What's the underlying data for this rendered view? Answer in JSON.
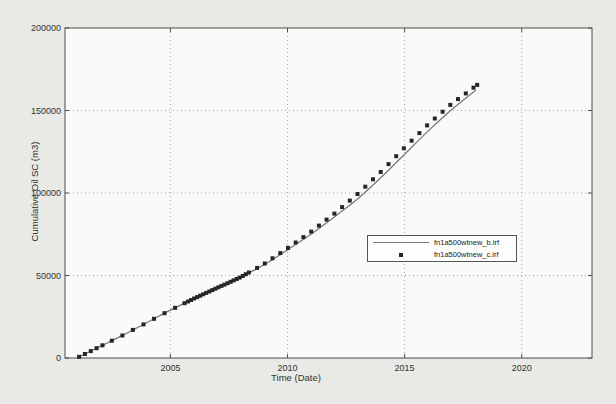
{
  "figure": {
    "bg_color": "#e9eae5",
    "plot_bg_color": "#fafaf8",
    "axis_color": "#4f4f4f",
    "grid_color": "#a8a8a4",
    "tick_text_color": "#333333"
  },
  "chart_data": {
    "type": "line",
    "title": "",
    "xlabel": "Time (Date)",
    "ylabel": "Cumulative Oil SC (m3)",
    "xlim": [
      2000.5,
      2023
    ],
    "ylim": [
      0,
      200000
    ],
    "x_ticks": [
      2005,
      2010,
      2015,
      2020
    ],
    "x_tick_labels": [
      "2005",
      "2010",
      "2015",
      "2020"
    ],
    "y_ticks": [
      0,
      50000,
      100000,
      150000,
      200000
    ],
    "y_tick_labels": [
      "0",
      "50000",
      "100000",
      "150000",
      "200000"
    ],
    "grid": "dotted",
    "legend_position": "right-center",
    "series": [
      {
        "name": "fn1a500wtnew_b.irf",
        "type": "line",
        "color": "#767676",
        "points": [
          [
            2001.0,
            0
          ],
          [
            2002,
            7000
          ],
          [
            2003,
            14000
          ],
          [
            2004,
            21500
          ],
          [
            2005,
            29000
          ],
          [
            2006,
            36000
          ],
          [
            2007,
            42500
          ],
          [
            2008,
            49000
          ],
          [
            2009,
            56500
          ],
          [
            2010,
            65500
          ],
          [
            2011,
            75000
          ],
          [
            2012,
            85500
          ],
          [
            2013,
            96500
          ],
          [
            2014,
            109500
          ],
          [
            2015,
            123500
          ],
          [
            2016,
            137500
          ],
          [
            2017,
            150500
          ],
          [
            2018.05,
            162500
          ]
        ]
      },
      {
        "name": "fn1a500wtnew_c.irf",
        "type": "scatter",
        "marker": "square",
        "color": "#262626",
        "points": [
          [
            2001.1,
            700
          ],
          [
            2001.35,
            2450
          ],
          [
            2001.6,
            4200
          ],
          [
            2001.85,
            5950
          ],
          [
            2002.1,
            7700
          ],
          [
            2002.5,
            10500
          ],
          [
            2002.95,
            13650
          ],
          [
            2003.4,
            17000
          ],
          [
            2003.85,
            20375
          ],
          [
            2004.3,
            23750
          ],
          [
            2004.75,
            27125
          ],
          [
            2005.2,
            30400
          ],
          [
            2005.6,
            33200
          ],
          [
            2005.75,
            34250
          ],
          [
            2005.88,
            35160
          ],
          [
            2006.01,
            36065
          ],
          [
            2006.14,
            36910
          ],
          [
            2006.27,
            37755
          ],
          [
            2006.4,
            38600
          ],
          [
            2006.53,
            39445
          ],
          [
            2006.66,
            40290
          ],
          [
            2006.79,
            41135
          ],
          [
            2006.92,
            41980
          ],
          [
            2007.05,
            42825
          ],
          [
            2007.18,
            43670
          ],
          [
            2007.31,
            44515
          ],
          [
            2007.44,
            45360
          ],
          [
            2007.57,
            46205
          ],
          [
            2007.7,
            47050
          ],
          [
            2007.83,
            47895
          ],
          [
            2007.96,
            48740
          ],
          [
            2008.09,
            49720
          ],
          [
            2008.22,
            50760
          ],
          [
            2008.35,
            51800
          ],
          [
            2008.7,
            54600
          ],
          [
            2009.03,
            57285
          ],
          [
            2009.36,
            60420
          ],
          [
            2009.69,
            63555
          ],
          [
            2010.02,
            66700
          ],
          [
            2010.35,
            70000
          ],
          [
            2010.68,
            73300
          ],
          [
            2011.01,
            76610
          ],
          [
            2011.34,
            80240
          ],
          [
            2011.67,
            83870
          ],
          [
            2012.0,
            87500
          ],
          [
            2012.33,
            91460
          ],
          [
            2012.66,
            95420
          ],
          [
            2012.99,
            99380
          ],
          [
            2013.32,
            103820
          ],
          [
            2013.65,
            108275
          ],
          [
            2013.98,
            112730
          ],
          [
            2014.31,
            117495
          ],
          [
            2014.64,
            122280
          ],
          [
            2014.97,
            127065
          ],
          [
            2015.3,
            131700
          ],
          [
            2015.63,
            136320
          ],
          [
            2015.96,
            140940
          ],
          [
            2016.29,
            145125
          ],
          [
            2016.62,
            149250
          ],
          [
            2016.95,
            153375
          ],
          [
            2017.28,
            156925
          ],
          [
            2017.61,
            160375
          ],
          [
            2017.94,
            163825
          ],
          [
            2018.1,
            165500
          ]
        ]
      }
    ]
  }
}
